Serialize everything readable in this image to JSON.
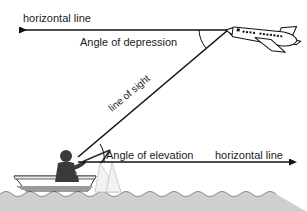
{
  "diagram": {
    "background_color": "#ffffff",
    "line_color": "#111111",
    "water_color": "#cfcfcf",
    "labels": {
      "horizontal_line_top": "horizontal line",
      "angle_of_depression": "Angle of depression",
      "line_of_sight": "line of sight",
      "angle_of_elevation": "Angle of elevation",
      "horizontal_line_bottom": "horizontal line"
    },
    "objects": {
      "airplane": "airplane",
      "boat": "boat",
      "observer": "fisherman",
      "water": "water",
      "fishing_rod": "fishing-rod"
    },
    "geometry": {
      "observer_point": [
        78,
        156
      ],
      "airplane_point": [
        228,
        30
      ],
      "top_arrow_end": [
        17,
        30
      ],
      "bottom_arrow_end": [
        292,
        162
      ]
    }
  }
}
